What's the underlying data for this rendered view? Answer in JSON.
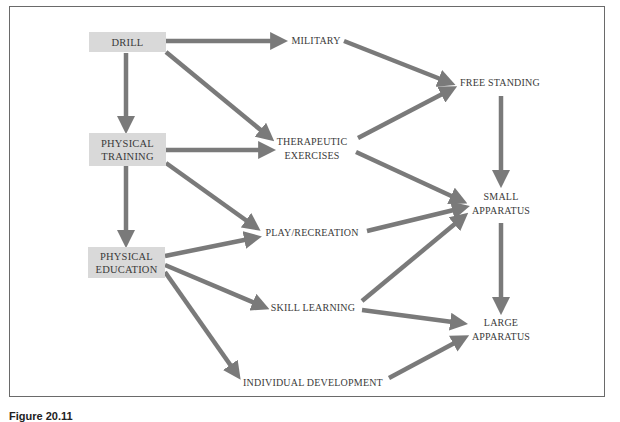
{
  "figure": {
    "caption": "Figure 20.11",
    "arrow_color": "#7a7a7a",
    "box_color": "#d9d9d9"
  },
  "nodes": {
    "drill": {
      "lines": [
        "DRILL"
      ]
    },
    "physical_training": {
      "lines": [
        "PHYSICAL",
        "TRAINING"
      ]
    },
    "physical_education": {
      "lines": [
        "PHYSICAL",
        "EDUCATION"
      ]
    },
    "military": {
      "lines": [
        "MILITARY"
      ]
    },
    "therapeutic_exercises": {
      "lines": [
        "THERAPEUTIC",
        "EXERCISES"
      ]
    },
    "play_recreation": {
      "lines": [
        "PLAY/RECREATION"
      ]
    },
    "skill_learning": {
      "lines": [
        "SKILL LEARNING"
      ]
    },
    "individual_development": {
      "lines": [
        "INDIVIDUAL DEVELOPMENT"
      ]
    },
    "free_standing": {
      "lines": [
        "FREE STANDING"
      ]
    },
    "small_apparatus": {
      "lines": [
        "SMALL",
        "APPARATUS"
      ]
    },
    "large_apparatus": {
      "lines": [
        "LARGE",
        "APPARATUS"
      ]
    }
  },
  "edges": [
    {
      "from": "DRILL",
      "to": "MILITARY"
    },
    {
      "from": "DRILL",
      "to": "THERAPEUTIC EXERCISES"
    },
    {
      "from": "DRILL",
      "to": "PHYSICAL TRAINING"
    },
    {
      "from": "PHYSICAL TRAINING",
      "to": "THERAPEUTIC EXERCISES"
    },
    {
      "from": "PHYSICAL TRAINING",
      "to": "PLAY/RECREATION"
    },
    {
      "from": "PHYSICAL TRAINING",
      "to": "PHYSICAL EDUCATION"
    },
    {
      "from": "PHYSICAL EDUCATION",
      "to": "PLAY/RECREATION"
    },
    {
      "from": "PHYSICAL EDUCATION",
      "to": "SKILL LEARNING"
    },
    {
      "from": "PHYSICAL EDUCATION",
      "to": "INDIVIDUAL DEVELOPMENT"
    },
    {
      "from": "MILITARY",
      "to": "FREE STANDING"
    },
    {
      "from": "THERAPEUTIC EXERCISES",
      "to": "FREE STANDING"
    },
    {
      "from": "THERAPEUTIC EXERCISES",
      "to": "SMALL APPARATUS"
    },
    {
      "from": "PLAY/RECREATION",
      "to": "SMALL APPARATUS"
    },
    {
      "from": "SKILL LEARNING",
      "to": "SMALL APPARATUS"
    },
    {
      "from": "SKILL LEARNING",
      "to": "LARGE APPARATUS"
    },
    {
      "from": "INDIVIDUAL DEVELOPMENT",
      "to": "LARGE APPARATUS"
    },
    {
      "from": "FREE STANDING",
      "to": "SMALL APPARATUS"
    },
    {
      "from": "SMALL APPARATUS",
      "to": "LARGE APPARATUS"
    }
  ]
}
